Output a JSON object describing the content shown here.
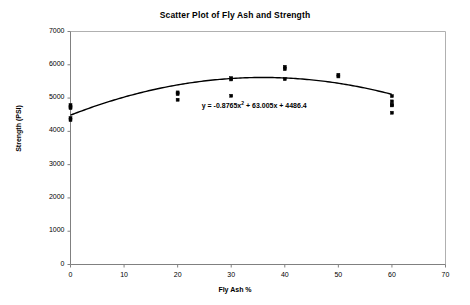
{
  "chart_data": {
    "type": "scatter",
    "title": "Scatter Plot of Fly Ash and Strength",
    "xlabel": "Fly Ash %",
    "ylabel": "Strength (PSI)",
    "xlim": [
      0,
      70
    ],
    "ylim": [
      0,
      7000
    ],
    "xticks": [
      0,
      10,
      20,
      30,
      40,
      50,
      60,
      70
    ],
    "yticks": [
      0,
      1000,
      2000,
      3000,
      4000,
      5000,
      6000,
      7000
    ],
    "xtick_labels": [
      "0",
      "10",
      "20",
      "30",
      "40",
      "50",
      "60",
      "70"
    ],
    "ytick_labels": [
      "0",
      "1000",
      "2000",
      "3000",
      "4000",
      "5000",
      "6000",
      "7000"
    ],
    "grid": false,
    "legend": false,
    "marker_color": "#000000",
    "trendline_color": "#000000",
    "frame_color": "#b0b0b0",
    "points": [
      {
        "x": 0,
        "y": 4790
      },
      {
        "x": 0,
        "y": 4740
      },
      {
        "x": 0,
        "y": 4700
      },
      {
        "x": 0,
        "y": 4400
      },
      {
        "x": 0,
        "y": 4340
      },
      {
        "x": 20,
        "y": 5170
      },
      {
        "x": 20,
        "y": 5120
      },
      {
        "x": 20,
        "y": 4950
      },
      {
        "x": 30,
        "y": 5600
      },
      {
        "x": 30,
        "y": 5560
      },
      {
        "x": 30,
        "y": 5070
      },
      {
        "x": 40,
        "y": 5940
      },
      {
        "x": 40,
        "y": 5870
      },
      {
        "x": 40,
        "y": 5570
      },
      {
        "x": 50,
        "y": 5700
      },
      {
        "x": 50,
        "y": 5650
      },
      {
        "x": 60,
        "y": 5060
      },
      {
        "x": 60,
        "y": 4900
      },
      {
        "x": 60,
        "y": 4800
      },
      {
        "x": 60,
        "y": 4780
      },
      {
        "x": 60,
        "y": 4560
      }
    ],
    "trendline": {
      "type": "polynomial",
      "degree": 2,
      "coefficients": [
        -0.8765,
        63.005,
        4486.4
      ],
      "equation_prefix": "y = -0.8765x",
      "equation_exponent": "2",
      "equation_suffix": " + 63.005x + 4486.4",
      "x_start": 0,
      "x_end": 60
    },
    "annotations": [
      {
        "name": "trendline-equation",
        "text": "y = -0.8765x2 + 63.005x + 4486.4",
        "x": 24.5,
        "y": 4800
      }
    ]
  }
}
